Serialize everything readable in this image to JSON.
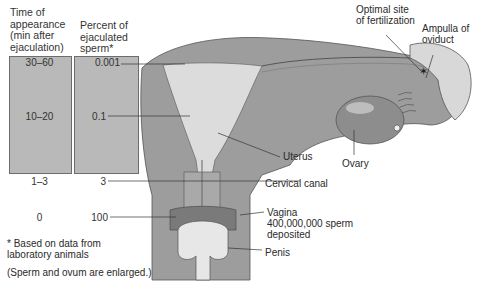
{
  "table": {
    "headers": {
      "time": "Time of\nappearance\n(min after\nejaculation)",
      "percent": "Percent of\nejaculated\nsperm*"
    },
    "rows": [
      {
        "time": "30–60",
        "percent": "0.001"
      },
      {
        "time": "10–20",
        "percent": "0.1"
      },
      {
        "time": "1–3",
        "percent": "3"
      },
      {
        "time": "0",
        "percent": "100"
      }
    ]
  },
  "footnotes": {
    "data_note": "* Based on data from\nlaboratory animals",
    "scale_note": "(Sperm and ovum are enlarged.)"
  },
  "labels": {
    "optimal_site": "Optimal site\nof fertilization",
    "ampulla": "Ampulla of\noviduct",
    "uterus": "Uterus",
    "ovary": "Ovary",
    "cervical_canal": "Cervical canal",
    "vagina": "Vagina\n400,000,000 sperm\ndeposited",
    "penis": "Penis"
  },
  "colors": {
    "column_fill": "#b9b9b9",
    "tissue_dark": "#9a9a9a",
    "tissue_light": "#d9d9d9"
  }
}
